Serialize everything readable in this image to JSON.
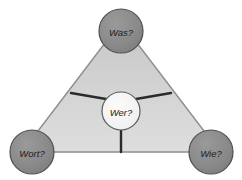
{
  "diagram": {
    "background_color": "#ffffff",
    "triangle": {
      "name": "question-triangle",
      "fill_color": "#d2d2d2",
      "stroke_color": "#8c8c8c",
      "fill_gradient_top": "#c8c8c8",
      "fill_gradient_bottom": "#dcdcdc"
    },
    "spoke_color": "#2b2b2b",
    "vertex_circle": {
      "fill_color": "#8a8a8a",
      "stroke_color": "#4a4a4a",
      "radius": 22
    },
    "center_circle": {
      "fill_color": "#f2f2f2",
      "stroke_color": "#5a5a5a",
      "radius": 19
    },
    "nodes": {
      "top": {
        "id": "node-was",
        "label": "Was?",
        "role": "vertex",
        "x": 121,
        "y": 31
      },
      "bottom_left": {
        "id": "node-wort",
        "label": "Wort?",
        "role": "vertex",
        "x": 32,
        "y": 152
      },
      "bottom_right": {
        "id": "node-wie",
        "label": "Wie?",
        "role": "vertex",
        "x": 211,
        "y": 152
      },
      "center": {
        "id": "node-wer",
        "label": "Wer?",
        "role": "center",
        "x": 121,
        "y": 111
      }
    },
    "spokes": [
      {
        "id": "spoke-center-to-upper-left",
        "from": "center",
        "to": "upper-left-edge"
      },
      {
        "id": "spoke-center-to-upper-right",
        "from": "center",
        "to": "upper-right-edge"
      },
      {
        "id": "spoke-center-to-bottom",
        "from": "center",
        "to": "base-edge"
      }
    ]
  }
}
